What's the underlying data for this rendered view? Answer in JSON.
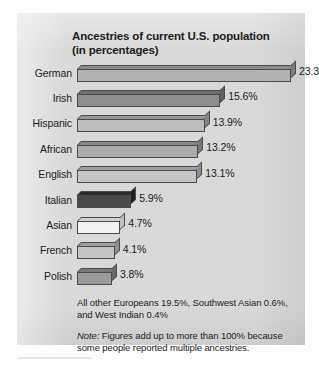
{
  "figure": {
    "title_line1": "Ancestries of current U.S. population",
    "title_line2": "(in percentages)",
    "footnote_other": "All other Europeans 19.5%, Southwest Asian 0.6%, and West Indian 0.4%",
    "footnote_note_word": "Note:",
    "footnote_note_text": " Figures add up to more than 100% because some people reported multiple ancestries."
  },
  "chart_data": {
    "type": "bar",
    "orientation": "horizontal",
    "title": "Ancestries of current U.S. population (in percentages)",
    "xlabel": "",
    "ylabel": "",
    "xlim": [
      0,
      23.3
    ],
    "grid": false,
    "legend": "none",
    "categories": [
      "German",
      "Irish",
      "Hispanic",
      "African",
      "English",
      "Italian",
      "Asian",
      "French",
      "Polish"
    ],
    "values": [
      23.3,
      15.6,
      13.9,
      13.2,
      13.1,
      5.9,
      4.7,
      4.1,
      3.8
    ],
    "value_labels": [
      "23.3%",
      "15.6%",
      "13.9%",
      "13.2%",
      "13.1%",
      "5.9%",
      "4.7%",
      "4.1%",
      "3.8%"
    ],
    "bar_colors": [
      "#b2b2b2",
      "#8e8e8e",
      "#bdbdbd",
      "#ababab",
      "#c6c6c6",
      "#4a4a4a",
      "#f2f2f2",
      "#c4c4c4",
      "#9b9b9b"
    ],
    "bar_top_colors": [
      "#8d8d8d",
      "#6f6f6f",
      "#969696",
      "#878787",
      "#9e9e9e",
      "#2c2c2c",
      "#d2d2d2",
      "#9e9e9e",
      "#787878"
    ],
    "bar_side_colors": [
      "#7d7d7d",
      "#616161",
      "#858585",
      "#787878",
      "#8d8d8d",
      "#1f1f1f",
      "#c2c2c2",
      "#8d8d8d",
      "#6a6a6a"
    ],
    "notes": [
      "All other Europeans 19.5%, Southwest Asian 0.6%, and West Indian 0.4%",
      "Note: Figures add up to more than 100% because some people reported multiple ancestries."
    ],
    "panel_background": "#d9d9d9"
  }
}
